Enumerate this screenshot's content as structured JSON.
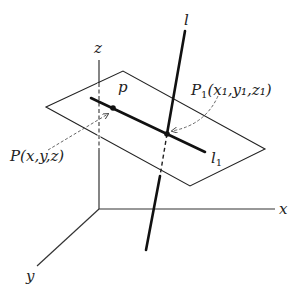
{
  "diagram": {
    "axes": {
      "x_label": "x",
      "y_label": "y",
      "z_label": "z"
    },
    "plane_label": "p",
    "line_label": "l",
    "line_in_plane_label": "l",
    "line_in_plane_subscript": "1",
    "point_P_label": "P(x,y,z)",
    "point_P1_label_main": "P",
    "point_P1_sub": "1",
    "point_P1_coords": "(x₁,y₁,z₁)"
  }
}
